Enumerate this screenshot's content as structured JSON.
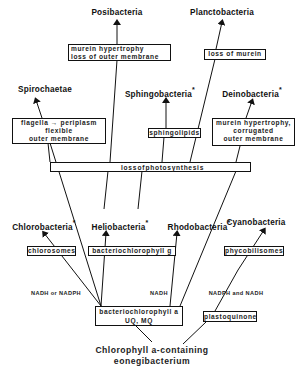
{
  "taxa": {
    "posibacteria": "Posibacteria",
    "planctobacteria": "Planctobacteria",
    "spirochaetae": "Spirochaetae",
    "sphingobacteria": "Sphingobacteria",
    "deinobacteria": "Deinobacteria",
    "chlorobacteria": "Chlorobacteria",
    "heliobacteria": "Heliobacteria",
    "rhodobacteria": "Rhodobacteria",
    "cyanobacteria": "Cyanobacteria",
    "marker": "*"
  },
  "boxes": {
    "posi_line1": "murein hypertrophy",
    "posi_line2": "loss of outer membrane",
    "plancto": "loss of murein",
    "spiro_line1": "flagella → periplasm",
    "spiro_line2": "flexible",
    "spiro_line3": "outer membrane",
    "sphingo": "sphingolipids",
    "deino_line1": "murein hypertrophy,",
    "deino_line2": "corrugated",
    "deino_line3": "outer membrane",
    "chloro": "chlorosomes",
    "helio": "bacteriochlorophyll g",
    "cyano": "phycobilisomes",
    "bchl_line1": "bacteriochlorophyll a",
    "bchl_line2": "UQ, MQ",
    "plasto": "plastoquinone"
  },
  "photosynthesis_bar": {
    "word1": "loss",
    "word2": "of",
    "word3": "photosynthesis"
  },
  "electron_donors": {
    "left": "NADH or NADPH",
    "middle": "NADH",
    "right": "NADPH and NADH"
  },
  "root": {
    "line1": "Chlorophyll a-containing",
    "line2": "eonegibacterium"
  }
}
